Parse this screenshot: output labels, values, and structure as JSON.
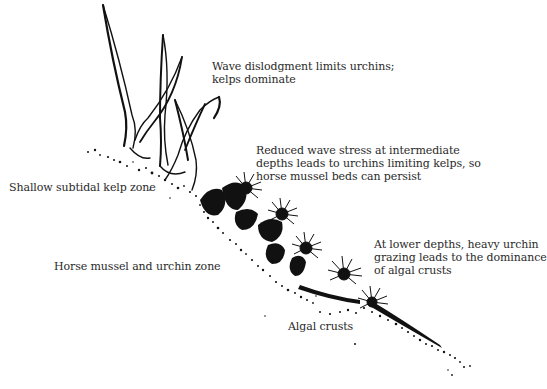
{
  "diagram": {
    "type": "ecological-zonation-illustration",
    "zones": [
      {
        "id": "kelp",
        "label": "Shallow subtidal kelp zone"
      },
      {
        "id": "mussel-urchin",
        "label": "Horse mussel and urchin zone"
      },
      {
        "id": "algal",
        "label": "Algal crusts"
      }
    ],
    "annotations": [
      {
        "id": "wave",
        "lines": [
          "Wave dislodgment limits urchins;",
          "kelps dominate"
        ]
      },
      {
        "id": "intermediate",
        "lines": [
          "Reduced wave stress at intermediate",
          "depths leads to urchins limiting kelps, so",
          "horse mussel beds can persist"
        ]
      },
      {
        "id": "lower",
        "lines": [
          "At lower depths, heavy urchin",
          "grazing leads to the dominance",
          "of algal crusts"
        ]
      }
    ],
    "colors": {
      "ink": "#111111",
      "text": "#2a2a2a",
      "background": "#ffffff"
    }
  }
}
